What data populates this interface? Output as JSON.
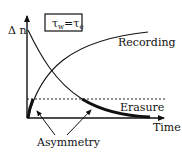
{
  "diagram": {
    "axis_y_label": "Δ n",
    "axis_x_label": "Time",
    "condition_box": "τw=τe",
    "condition_tau": "τ",
    "condition_sub_w": "w",
    "condition_eq": "=",
    "condition_sub_e": "e",
    "curves": [
      {
        "name": "Recording",
        "label": "Recording",
        "shape": "rising-saturating"
      },
      {
        "name": "Erasure",
        "label": "Erasure",
        "shape": "exponential-decay"
      }
    ],
    "threshold_line": "dashed",
    "annotation": "Asymmetry",
    "colors": {
      "line": "#111111",
      "background": "#ffffff"
    }
  }
}
